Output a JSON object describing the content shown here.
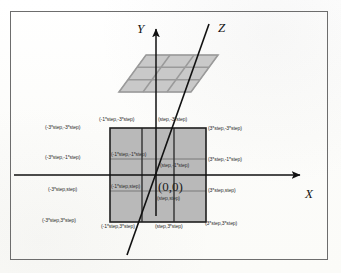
{
  "figure": {
    "background_color": "#fdfdfb",
    "frame_color": "#6d6d6d",
    "grid_fill_color": "#b9b9b9",
    "grid_line_color": "#8f8f8f",
    "plane_fill_color": "#c9c9c9",
    "axis_color": "#111111",
    "label_color": "#2e2e2e"
  },
  "axes": [
    {
      "name": "Y",
      "label": "Y",
      "direction": "up"
    },
    {
      "name": "Z",
      "label": "Z",
      "direction": "diagonal-up-right"
    },
    {
      "name": "X",
      "label": "X",
      "direction": "right"
    }
  ],
  "origin": {
    "label": "(0,0)"
  },
  "grid": {
    "rows": 3,
    "cols": 3,
    "step_unit": "step"
  },
  "labels": {
    "left_column": [
      {
        "id": "left-top",
        "text": "(-3*step,-3*step)"
      },
      {
        "id": "left-upper-mid",
        "text": "(-3*step,-1*step)"
      },
      {
        "id": "left-lower-mid",
        "text": "(-3*step,step)"
      },
      {
        "id": "left-bottom",
        "text": "(-3*step,3*step)"
      }
    ],
    "right_column": [
      {
        "id": "right-top",
        "text": "(3*step,-3*step)"
      },
      {
        "id": "right-upper-mid",
        "text": "(3*step,-1*step)"
      },
      {
        "id": "right-lower-mid",
        "text": "(3*step,step)"
      },
      {
        "id": "right-bottom",
        "text": "(3*step,3*step)"
      }
    ],
    "top_row": [
      {
        "id": "top-left-inner",
        "text": "(-1*step,-3*step)"
      },
      {
        "id": "top-right-inner",
        "text": "(step,-3*step)"
      }
    ],
    "bottom_row": [
      {
        "id": "bottom-left-inner",
        "text": "(-1*step,3*step)"
      },
      {
        "id": "bottom-right-inner",
        "text": "(step,3*step)"
      }
    ],
    "interior": [
      {
        "id": "interior-upper-left",
        "text": "(-1*step,-1*step)"
      },
      {
        "id": "interior-upper-right",
        "text": "(step,-1*step)"
      },
      {
        "id": "interior-lower-left",
        "text": "(-1*step,step)"
      },
      {
        "id": "interior-lower-right",
        "text": "(step,step)"
      }
    ]
  }
}
